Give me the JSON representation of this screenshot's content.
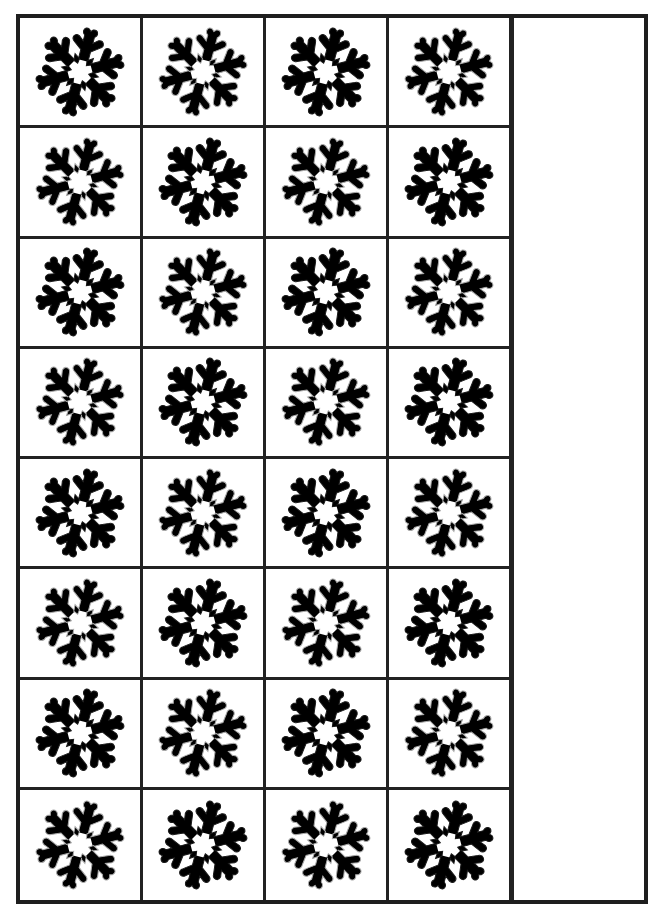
{
  "worksheet": {
    "title": "",
    "grid": {
      "rows": 8,
      "columns": 4,
      "icon": "snowflake-icon",
      "pattern": "checkerboard",
      "colors": {
        "dark": "#1a1a1a",
        "light": "#a9a9a9",
        "grid_line": "#222222",
        "background": "#ffffff"
      },
      "cells": [
        [
          "dark",
          "light",
          "dark",
          "light"
        ],
        [
          "light",
          "dark",
          "light",
          "dark"
        ],
        [
          "dark",
          "light",
          "dark",
          "light"
        ],
        [
          "light",
          "dark",
          "light",
          "dark"
        ],
        [
          "dark",
          "light",
          "dark",
          "light"
        ],
        [
          "light",
          "dark",
          "light",
          "dark"
        ],
        [
          "dark",
          "light",
          "dark",
          "light"
        ],
        [
          "light",
          "dark",
          "light",
          "dark"
        ]
      ]
    },
    "side_column": {
      "content": ""
    }
  }
}
